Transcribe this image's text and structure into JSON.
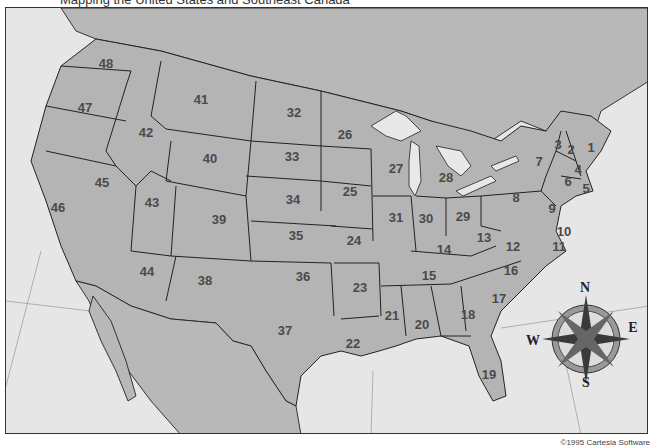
{
  "caption": "Mapping the United States and Southeast Canada",
  "copyright": "©1995 Cartesia Software",
  "colors": {
    "land": "#b4b4b4",
    "water": "#e6e6e6",
    "border": "#222222",
    "label": "#4a4a4a"
  },
  "compass": {
    "north": "N",
    "south": "S",
    "east": "E",
    "west": "W"
  },
  "states": [
    {
      "id": "1",
      "x": 590,
      "y": 146
    },
    {
      "id": "2",
      "x": 570,
      "y": 148
    },
    {
      "id": "3",
      "x": 557,
      "y": 143
    },
    {
      "id": "4",
      "x": 577,
      "y": 168
    },
    {
      "id": "5",
      "x": 585,
      "y": 187
    },
    {
      "id": "6",
      "x": 567,
      "y": 180
    },
    {
      "id": "7",
      "x": 538,
      "y": 160
    },
    {
      "id": "8",
      "x": 515,
      "y": 196
    },
    {
      "id": "9",
      "x": 551,
      "y": 207
    },
    {
      "id": "10",
      "x": 563,
      "y": 230
    },
    {
      "id": "11",
      "x": 558,
      "y": 245
    },
    {
      "id": "12",
      "x": 512,
      "y": 245
    },
    {
      "id": "13",
      "x": 483,
      "y": 236
    },
    {
      "id": "14",
      "x": 443,
      "y": 248
    },
    {
      "id": "15",
      "x": 428,
      "y": 274
    },
    {
      "id": "16",
      "x": 510,
      "y": 269
    },
    {
      "id": "17",
      "x": 498,
      "y": 297
    },
    {
      "id": "18",
      "x": 467,
      "y": 313
    },
    {
      "id": "19",
      "x": 488,
      "y": 373
    },
    {
      "id": "20",
      "x": 421,
      "y": 323
    },
    {
      "id": "21",
      "x": 391,
      "y": 314
    },
    {
      "id": "22",
      "x": 352,
      "y": 342
    },
    {
      "id": "23",
      "x": 359,
      "y": 286
    },
    {
      "id": "24",
      "x": 353,
      "y": 239
    },
    {
      "id": "25",
      "x": 349,
      "y": 190
    },
    {
      "id": "26",
      "x": 344,
      "y": 133
    },
    {
      "id": "27",
      "x": 395,
      "y": 167
    },
    {
      "id": "28",
      "x": 445,
      "y": 176
    },
    {
      "id": "29",
      "x": 462,
      "y": 215
    },
    {
      "id": "30",
      "x": 425,
      "y": 217
    },
    {
      "id": "31",
      "x": 395,
      "y": 216
    },
    {
      "id": "32",
      "x": 293,
      "y": 111
    },
    {
      "id": "33",
      "x": 291,
      "y": 155
    },
    {
      "id": "34",
      "x": 292,
      "y": 198
    },
    {
      "id": "35",
      "x": 295,
      "y": 234
    },
    {
      "id": "36",
      "x": 302,
      "y": 275
    },
    {
      "id": "37",
      "x": 284,
      "y": 329
    },
    {
      "id": "38",
      "x": 204,
      "y": 279
    },
    {
      "id": "39",
      "x": 218,
      "y": 218
    },
    {
      "id": "40",
      "x": 209,
      "y": 157
    },
    {
      "id": "41",
      "x": 200,
      "y": 98
    },
    {
      "id": "42",
      "x": 145,
      "y": 131
    },
    {
      "id": "43",
      "x": 151,
      "y": 201
    },
    {
      "id": "44",
      "x": 146,
      "y": 270
    },
    {
      "id": "45",
      "x": 101,
      "y": 181
    },
    {
      "id": "46",
      "x": 57,
      "y": 206
    },
    {
      "id": "47",
      "x": 84,
      "y": 106
    },
    {
      "id": "48",
      "x": 105,
      "y": 62
    }
  ]
}
